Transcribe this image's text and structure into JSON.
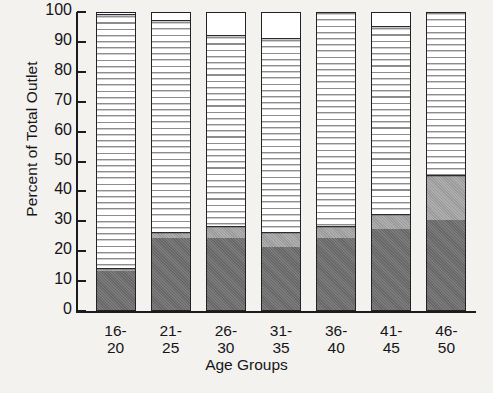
{
  "chart_data": {
    "type": "bar",
    "stacked": true,
    "title": "",
    "subtitle": "",
    "xlabel": "Age Groups",
    "ylabel": "Percent of Total Outlet",
    "ylim": [
      0,
      100
    ],
    "yticks": [
      0,
      10,
      20,
      30,
      40,
      50,
      60,
      70,
      80,
      90,
      100
    ],
    "ytick_labels": [
      "0",
      "10",
      "20",
      "30",
      "40",
      "50",
      "60",
      "70",
      "80",
      "90",
      "100"
    ],
    "grid": false,
    "legend": "none",
    "categories": [
      "16-20",
      "21-25",
      "26-30",
      "31-35",
      "36-40",
      "41-45",
      "46-50"
    ],
    "category_lines": [
      [
        "16-",
        "20"
      ],
      [
        "21-",
        "25"
      ],
      [
        "26-",
        "30"
      ],
      [
        "31-",
        "35"
      ],
      [
        "36-",
        "40"
      ],
      [
        "41-",
        "45"
      ],
      [
        "46-",
        "50"
      ]
    ],
    "series": [
      {
        "name": "dark-gray-segment",
        "fill": "solid-dark-gray",
        "color": "#6d6d6d",
        "values": [
          13,
          24,
          24,
          21,
          24,
          27,
          30
        ]
      },
      {
        "name": "medium-gray-segment",
        "fill": "solid-medium-gray",
        "color": "#a2a2a2",
        "values": [
          1,
          2,
          4,
          5,
          4,
          5,
          15
        ]
      },
      {
        "name": "striped-segment",
        "fill": "horizontal-stripes",
        "color": "#8d8d8d",
        "values": [
          85,
          71,
          64,
          65,
          72,
          63,
          55
        ]
      },
      {
        "name": "white-segment",
        "fill": "solid-white",
        "color": "#ffffff",
        "values": [
          1,
          3,
          8,
          9,
          0,
          5,
          0
        ]
      }
    ],
    "colors": {
      "axis": "#1b1b1f",
      "background": "#f4f2ef",
      "text": "#15151a"
    }
  }
}
